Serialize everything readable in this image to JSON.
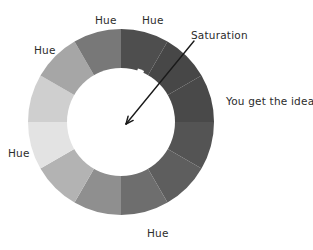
{
  "diagram": {
    "background_color": "#ffffff",
    "ink_color": "#2b2b2b"
  },
  "wheel": {
    "center_x": 121,
    "center_y": 122,
    "outer_radius": 93,
    "inner_radius": 54,
    "inner_fill": "#ffffff",
    "start_angle_deg": 0,
    "segment_count": 12,
    "segments": [
      {
        "index": 0,
        "start_deg": 0,
        "end_deg": 30,
        "color": "#4e4e4e"
      },
      {
        "index": 1,
        "start_deg": 30,
        "end_deg": 60,
        "color": "#474747"
      },
      {
        "index": 2,
        "start_deg": 60,
        "end_deg": 90,
        "color": "#494949"
      },
      {
        "index": 3,
        "start_deg": 90,
        "end_deg": 120,
        "color": "#545454"
      },
      {
        "index": 4,
        "start_deg": 120,
        "end_deg": 150,
        "color": "#5e5e5e"
      },
      {
        "index": 5,
        "start_deg": 150,
        "end_deg": 180,
        "color": "#6e6e6e"
      },
      {
        "index": 6,
        "start_deg": 180,
        "end_deg": 210,
        "color": "#8f8f8f"
      },
      {
        "index": 7,
        "start_deg": 210,
        "end_deg": 240,
        "color": "#b3b3b3"
      },
      {
        "index": 8,
        "start_deg": 240,
        "end_deg": 270,
        "color": "#e3e3e3"
      },
      {
        "index": 9,
        "start_deg": 270,
        "end_deg": 300,
        "color": "#cfcfcf"
      },
      {
        "index": 10,
        "start_deg": 300,
        "end_deg": 330,
        "color": "#a6a6a6"
      },
      {
        "index": 11,
        "start_deg": 330,
        "end_deg": 360,
        "color": "#787878"
      }
    ]
  },
  "saturation_wedge": {
    "color": "#ffffff",
    "angle_deg": 21,
    "half_width_deg": 3.4,
    "outer_radius": 56,
    "description": "white radial wedge from center toward upper-right"
  },
  "arrow": {
    "color": "#1a1a1a",
    "stroke_width": 1.4,
    "tail_x": 194,
    "tail_y": 41,
    "head_x": 126,
    "head_y": 124,
    "head_size": 8
  },
  "labels": {
    "hue": [
      {
        "text": "Hue",
        "x": 95,
        "y": 15,
        "anchor": "start"
      },
      {
        "text": "Hue",
        "x": 142,
        "y": 15,
        "anchor": "start"
      },
      {
        "text": "Hue",
        "x": 34,
        "y": 45,
        "anchor": "start"
      },
      {
        "text": "Hue",
        "x": 8,
        "y": 148,
        "anchor": "start"
      },
      {
        "text": "Hue",
        "x": 147,
        "y": 228,
        "anchor": "start"
      }
    ],
    "saturation": {
      "text": "Saturation",
      "x": 191,
      "y": 30
    },
    "idea": {
      "text": "You get the idea",
      "x": 226,
      "y": 96
    }
  }
}
